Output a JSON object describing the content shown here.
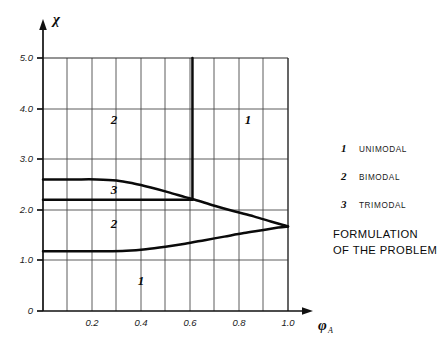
{
  "chart_data": {
    "type": "line",
    "title": "",
    "xlabel": "φₐ",
    "ylabel": "χ",
    "xlim": [
      0.0,
      1.08
    ],
    "ylim": [
      0.0,
      5.35
    ],
    "grid": true,
    "x_ticks": [
      "0",
      "0.2",
      "0.4",
      "0.6",
      "0.8",
      "1.0"
    ],
    "x_tick_values": [
      0.0,
      0.2,
      0.4,
      0.6,
      0.8,
      1.0
    ],
    "x_minor_gridlines": [
      0.1,
      0.3,
      0.5,
      0.7,
      0.9
    ],
    "y_ticks": [
      "0",
      "1.0",
      "2.0",
      "3.0",
      "4.0",
      "5.0"
    ],
    "y_tick_values": [
      0.0,
      1.0,
      2.0,
      3.0,
      4.0,
      5.0
    ],
    "legend_position": "right",
    "series": [
      {
        "name": "upper-boundary",
        "comment": "upper trimodal boundary: flat at chi=2.60 then descends to cusp at (1.0,1.67)",
        "points": [
          [
            0.0,
            2.6
          ],
          [
            0.12,
            2.6
          ],
          [
            0.22,
            2.6
          ],
          [
            0.3,
            2.58
          ],
          [
            0.37,
            2.52
          ],
          [
            0.44,
            2.44
          ],
          [
            0.51,
            2.35
          ],
          [
            0.58,
            2.25
          ],
          [
            0.62,
            2.2
          ],
          [
            0.7,
            2.08
          ],
          [
            0.78,
            1.97
          ],
          [
            0.86,
            1.87
          ],
          [
            0.93,
            1.77
          ],
          [
            0.98,
            1.7
          ],
          [
            1.0,
            1.67
          ]
        ]
      },
      {
        "name": "middle-boundary",
        "comment": "horizontal trimodal lower edge at chi=2.20 terminating at the vertical line x=0.61",
        "points": [
          [
            0.0,
            2.2
          ],
          [
            0.2,
            2.2
          ],
          [
            0.4,
            2.2
          ],
          [
            0.55,
            2.2
          ],
          [
            0.61,
            2.2
          ]
        ]
      },
      {
        "name": "lower-boundary",
        "comment": "lower bimodal boundary: flat at chi=1.18 then rises to cusp at (1.0,1.67)",
        "points": [
          [
            0.0,
            1.18
          ],
          [
            0.14,
            1.18
          ],
          [
            0.26,
            1.18
          ],
          [
            0.34,
            1.19
          ],
          [
            0.42,
            1.22
          ],
          [
            0.5,
            1.27
          ],
          [
            0.58,
            1.33
          ],
          [
            0.66,
            1.4
          ],
          [
            0.74,
            1.47
          ],
          [
            0.82,
            1.54
          ],
          [
            0.9,
            1.6
          ],
          [
            0.96,
            1.65
          ],
          [
            1.0,
            1.67
          ]
        ]
      },
      {
        "name": "vertical-boundary",
        "comment": "vertical separatrix at phi=0.61 from chi=2.20 up to chi=5.0",
        "points": [
          [
            0.61,
            2.2
          ],
          [
            0.61,
            5.0
          ]
        ]
      }
    ],
    "region_labels": [
      {
        "text": "2",
        "x": 0.29,
        "y": 3.57,
        "name": "region-label-bimodal-upper"
      },
      {
        "text": "1",
        "x": 0.85,
        "y": 3.57,
        "name": "region-label-unimodal-right"
      },
      {
        "text": "3",
        "x": 0.29,
        "y": 2.38,
        "name": "region-label-trimodal"
      },
      {
        "text": "2",
        "x": 0.29,
        "y": 1.72,
        "name": "region-label-bimodal-lower"
      },
      {
        "text": "1",
        "x": 0.4,
        "y": 0.55,
        "name": "region-label-unimodal-bottom"
      }
    ]
  },
  "legend": {
    "entries": [
      {
        "num": "1",
        "label": "UNIMODAL"
      },
      {
        "num": "2",
        "label": "BIMODAL"
      },
      {
        "num": "3",
        "label": "TRIMODAL"
      }
    ]
  },
  "caption": {
    "line1": "FORMULATION",
    "line2": "OF THE PROBLEM"
  },
  "axes": {
    "y_symbol": "χ",
    "x_symbol": "φ",
    "x_subscript": "A"
  }
}
